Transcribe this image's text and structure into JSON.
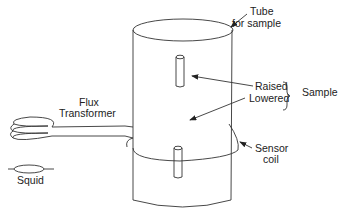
{
  "diagram": {
    "labels": {
      "tube_line1": "Tube",
      "tube_line2": "for sample",
      "raised": "Raised",
      "lowered": "Lowered",
      "sample": "Sample",
      "flux_line1": "Flux",
      "flux_line2": "Transformer",
      "sensor_line1": "Sensor",
      "sensor_line2": "coil",
      "squid": "Squid"
    },
    "colors": {
      "stroke": "#333333",
      "text": "#222222",
      "background": "#ffffff"
    }
  }
}
